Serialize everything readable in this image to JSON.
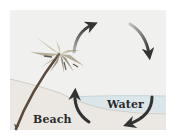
{
  "diagram": {
    "type": "sea-breeze-circulation",
    "labels": {
      "beach": "Beach",
      "water": "Water"
    },
    "arrows": [
      {
        "name": "rising-air-arrow",
        "direction": "up"
      },
      {
        "name": "upper-flow-arrow",
        "direction": "down"
      },
      {
        "name": "sinking-air-arrow",
        "direction": "down-left"
      },
      {
        "name": "surface-flow-arrow",
        "direction": "up"
      }
    ],
    "colors": {
      "background": "#f0f0ef",
      "water": "#dbe6ea",
      "sand": "#ebe6df",
      "arrow": "#3a3a3a",
      "trunk": "#5b4a3c",
      "fronds_light": "#c9c2a8",
      "fronds_mid": "#9f9a82",
      "fronds_dark": "#6e6a58"
    }
  }
}
